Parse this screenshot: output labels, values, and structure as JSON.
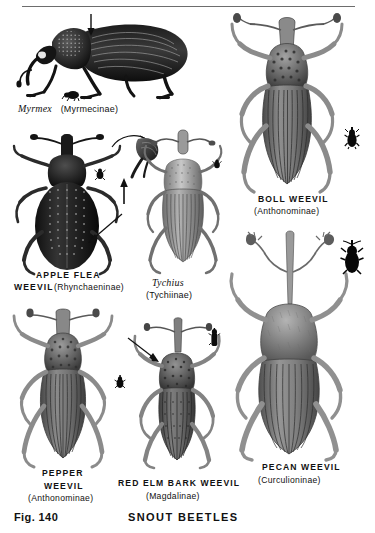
{
  "page": {
    "figure_number": "Fig. 140",
    "plate_title": "SNOUT BEETLES",
    "background_color": "#ffffff",
    "ink_color": "#111111",
    "rule_color": "#6d6d6d"
  },
  "specimens": [
    {
      "id": "myrmex",
      "common_name": "Myrmex",
      "subfamily": "(Myrmecinae)",
      "name_style": "italic",
      "view": "lateral",
      "has_size_silhouette": true,
      "has_arrow": true,
      "label_x": 18,
      "label_y": 104
    },
    {
      "id": "apple-flea-weevil",
      "common_name_line1": "APPLE FLEA",
      "common_name_line2": "WEEVIL",
      "subfamily": "(Rhynchaeninae)",
      "name_style": "caps",
      "view": "dorsal",
      "has_size_silhouette": true,
      "has_detail_inset": true,
      "has_arrow": true,
      "label_x": 8,
      "label_y": 272
    },
    {
      "id": "tychius",
      "common_name": "Tychius",
      "subfamily": "(Tychiinae)",
      "name_style": "italic",
      "view": "dorsal",
      "has_size_silhouette": true,
      "label_x": 140,
      "label_y": 278
    },
    {
      "id": "boll-weevil",
      "common_name": "BOLL WEEVIL",
      "subfamily": "(Anthonominae)",
      "name_style": "caps",
      "view": "dorsal",
      "has_size_silhouette": true,
      "label_x": 253,
      "label_y": 196
    },
    {
      "id": "pepper-weevil",
      "common_name_line1": "PEPPER",
      "common_name_line2": "WEEVIL",
      "subfamily": "(Anthonominae)",
      "name_style": "caps",
      "view": "dorsal",
      "has_size_silhouette": true,
      "label_x": 28,
      "label_y": 473
    },
    {
      "id": "red-elm-bark-weevil",
      "common_name": "RED ELM BARK WEEVIL",
      "subfamily": "(Magdalinae)",
      "name_style": "caps",
      "view": "dorsal",
      "has_size_silhouette": true,
      "has_arrow": true,
      "label_x": 118,
      "label_y": 480
    },
    {
      "id": "pecan-weevil",
      "common_name": "PECAN WEEVIL",
      "subfamily": "(Curculioninae)",
      "name_style": "caps",
      "view": "dorsal",
      "has_size_silhouette": true,
      "label_x": 248,
      "label_y": 464
    }
  ]
}
